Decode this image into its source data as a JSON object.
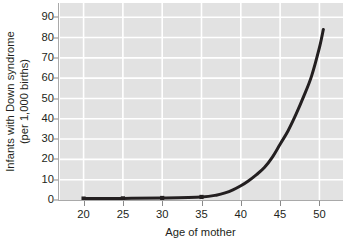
{
  "chart_data": {
    "type": "line",
    "title": "",
    "subtitle": "",
    "xlabel": "Age of mother",
    "ylabel_line1": "Infants with Down syndrome",
    "ylabel_line2": "(per 1,000 births)",
    "ylabel": "Infants with Down syndrome (per 1,000 births)",
    "xlim": [
      17,
      53
    ],
    "ylim": [
      0,
      97
    ],
    "xticks": [
      20,
      25,
      30,
      35,
      40,
      45,
      50
    ],
    "xtick_labels": [
      "20",
      "25",
      "30",
      "35",
      "40",
      "45",
      "50"
    ],
    "yticks": [
      0,
      10,
      20,
      30,
      40,
      50,
      60,
      70,
      80,
      90
    ],
    "ytick_labels": [
      "0",
      "10",
      "20",
      "30",
      "40",
      "50",
      "60",
      "70",
      "80",
      "90"
    ],
    "grid": true,
    "grid_color": "#ffffff",
    "plot_background": "#e2e2e2",
    "line_color": "#231f20",
    "line_width": 3,
    "legend": null,
    "legend_position": "none",
    "annotations": [],
    "marker_style": "square",
    "marker_ages": [
      20,
      25,
      30,
      35
    ],
    "series": [
      {
        "name": "Infants with Down syndrome per 1,000 births",
        "x": [
          20,
          25,
          30,
          35,
          37,
          38,
          39,
          40,
          41,
          42,
          43,
          44,
          45,
          46,
          47,
          48,
          49,
          50,
          50.5
        ],
        "values": [
          0.7,
          0.8,
          1.0,
          1.5,
          2.5,
          3.5,
          5.0,
          7.0,
          9.5,
          12.5,
          16.0,
          21.0,
          27.5,
          34.0,
          42.0,
          51.0,
          61.0,
          75.0,
          84.0
        ]
      }
    ]
  },
  "axis": {
    "axis_line_color": "#a9a9a9",
    "tick_color": "#8a8a8a",
    "text_color": "#231f20"
  }
}
